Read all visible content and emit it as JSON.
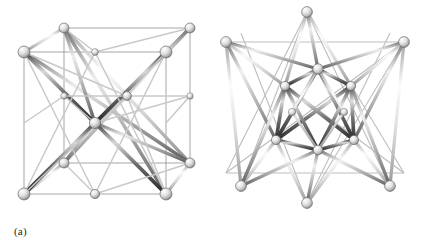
{
  "figure": {
    "kind": "ball-and-stick-polyhedra",
    "background_color": "#ffffff",
    "ink_color": "#231f20",
    "rod_light_color": "#f2f2f2",
    "rod_mid_color": "#b8b8b8",
    "rod_dark_color": "#4a4a4a",
    "node_color": "#e8e8e8",
    "node_edge_color": "#6b6b6b",
    "panels": [
      {
        "id": "a",
        "label": "(a)",
        "title": "cube-framed polyhedral rod model",
        "vertex_count": 14,
        "outer_shape": "cube",
        "inner_shape": "face-diagonal bracing with central node"
      },
      {
        "id": "b",
        "label": "(b)",
        "title": "stellated octahedron rod model",
        "vertex_count": 14,
        "outer_shape": "six-pointed star",
        "inner_shape": "octahedron core"
      }
    ]
  },
  "labels": {
    "panel_a": "(a)",
    "panel_b": "(b)"
  }
}
